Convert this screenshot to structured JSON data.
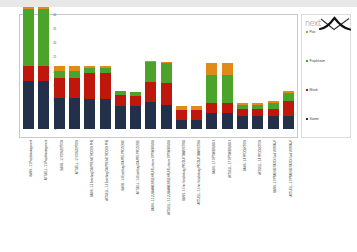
{
  "logo": {
    "wordmark": "next",
    "swoosh_color": "#111111",
    "wordmark_color": "#b8b8b8"
  },
  "legend": {
    "position": "right",
    "items": [
      {
        "label": "Plan",
        "color": "#e08a18"
      },
      {
        "label": "Projektteam",
        "color": "#4ca32a"
      },
      {
        "label": "Mitarb",
        "color": "#c0170d"
      },
      {
        "label": "Stamm",
        "color": "#23304a"
      }
    ]
  },
  "chart_data": {
    "type": "bar",
    "stacked": true,
    "title": "",
    "xlabel": "",
    "ylabel": "",
    "ylim": [
      0,
      40
    ],
    "yticks": [
      0,
      5,
      10,
      15,
      20,
      25,
      30,
      35,
      40
    ],
    "grid": false,
    "legend_position": "right",
    "categories": [
      "BASIS - 1.1 Projektmanagement",
      "AKTUELL - 1.1 Projektmanagement",
      "BASIS - 1.2 KONZEPTION",
      "AKTUELL - 1.2 KONZEPTION",
      "BASIS - 1.3 Erstellung DIA PRE METHODEN PHB",
      "AKTUELL - 1.3 Erstellung DIA PRE METHODEN PHB",
      "BASIS - 1.4 Erstellung DIA PRE-PROZESSE",
      "AKTUELL - 1.4 Erstellung DIA PRE-PROZESSE",
      "BASIS - 1.5 ZUSAMMENFUEHRUNG, interne OPTIMIERUNG",
      "AKTUELL - 1.5 ZUSAMMENFUEHRUNG, interne OPTIMIERUNG",
      "BASIS - 1.6 Inc Verarbeitung PRODUKTMARKETING",
      "AKTUELL - 1.6 Inc Verarbeitung PRODUKTMARKETING",
      "BASIS - 1.7 OPTIMIERUNG II",
      "AKTUELL - 1.7 OPTIMIERUNG II",
      "BASIS - 1.8 PRODUKTION",
      "AKTUELL - 1.8 PRODUKTION",
      "BASIS - 1.9 PRAESENTATION und VERKAUF",
      "AKTUELL - 1.9 PRAESENTATION und VERKAUF"
    ],
    "series": [
      {
        "name": "Stamm",
        "color": "#23304a",
        "values": [
          17,
          17,
          11,
          11,
          10.5,
          10.5,
          8,
          8,
          9.5,
          8.5,
          3,
          3,
          5.5,
          5.5,
          4.5,
          4.5,
          4.5,
          4.5
        ]
      },
      {
        "name": "Mitarb",
        "color": "#c0170d",
        "values": [
          5,
          5,
          7,
          7,
          9,
          9,
          4,
          3.5,
          7,
          7.5,
          3.5,
          3.5,
          3.5,
          3.5,
          2.5,
          2.5,
          2.5,
          5.5
        ]
      },
      {
        "name": "Projektteam",
        "color": "#4ca32a",
        "values": [
          20,
          20,
          2.5,
          2.5,
          2,
          2,
          1.5,
          1.5,
          7,
          7,
          0,
          0,
          10,
          10,
          1.5,
          1.5,
          2,
          2.5
        ]
      },
      {
        "name": "Plan",
        "color": "#e08a18",
        "values": [
          0.8,
          0.8,
          1.5,
          1.5,
          0.5,
          0.5,
          0,
          0,
          0.5,
          0.5,
          1.5,
          1.5,
          4,
          4,
          0.5,
          0.5,
          1,
          0.8
        ]
      }
    ],
    "totals": [
      42.8,
      42.8,
      22,
      22,
      22,
      22,
      13.5,
      13,
      24,
      23.5,
      8,
      8,
      23,
      23,
      9,
      9,
      10,
      13.3
    ]
  }
}
